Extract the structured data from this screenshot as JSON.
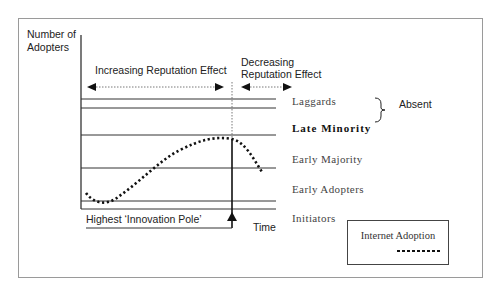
{
  "diagram": {
    "y_axis_label_line1": "Number of",
    "y_axis_label_line2": "Adopters",
    "x_axis_label": "Time",
    "increasing_effect": "Increasing Reputation Effect",
    "decreasing_effect_line1": "Decreasing",
    "decreasing_effect_line2": "Reputation Effect",
    "absent_label": "Absent",
    "pole_label": "Highest ‘Innovation Pole’",
    "categories": [
      {
        "label": "Laggards",
        "bold": false
      },
      {
        "label": "Late Minority",
        "bold": true
      },
      {
        "label": "Early Majority",
        "bold": false
      },
      {
        "label": "Early Adopters",
        "bold": false
      },
      {
        "label": "Initiators",
        "bold": false
      }
    ],
    "legend": {
      "title": "Internet Adoption",
      "series_style": "dotted",
      "color": "#111111"
    }
  }
}
